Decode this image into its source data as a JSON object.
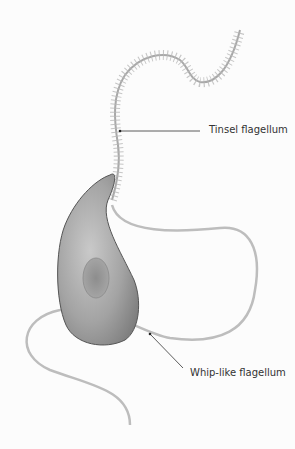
{
  "diagram": {
    "labels": {
      "tinsel": "Tinsel flagellum",
      "whip": "Whip-like flagellum"
    },
    "colors": {
      "cell_body": "#a9a9a9",
      "flagellum": "#b8b8b8",
      "leader_line": "#333333",
      "text": "#333333"
    }
  }
}
